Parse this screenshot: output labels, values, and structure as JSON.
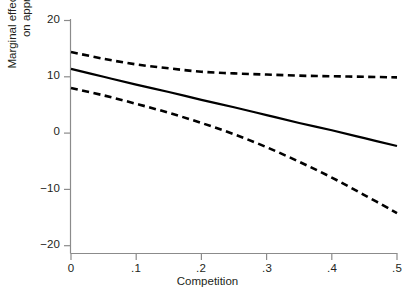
{
  "chart_data": {
    "type": "line",
    "title": "",
    "subtitle": "",
    "xlabel": "Competition",
    "ylabel_line1": "Marginal effect of grants",
    "ylabel_line2": "on approval",
    "ylabel": "Marginal effect of grants on approval",
    "xlim": [
      0,
      0.5
    ],
    "ylim": [
      -20,
      20
    ],
    "xticks": [
      0,
      0.1,
      0.2,
      0.3,
      0.4,
      0.5
    ],
    "xtick_labels": [
      "0",
      ".1",
      ".2",
      ".3",
      ".4",
      ".5"
    ],
    "yticks": [
      20,
      10,
      0,
      -10,
      -20
    ],
    "ytick_labels": [
      "20",
      "10",
      "0",
      "−10",
      "−20"
    ],
    "grid": false,
    "legend": "none",
    "axis_color": "#8b8b8b",
    "line_color": "#000000",
    "series": [
      {
        "name": "Upper confidence bound",
        "style": "dashed",
        "x": [
          0,
          0.05,
          0.1,
          0.15,
          0.2,
          0.25,
          0.3,
          0.35,
          0.4,
          0.45,
          0.5
        ],
        "values": [
          14.4,
          13.2,
          12.2,
          11.5,
          10.9,
          10.6,
          10.4,
          10.2,
          10.1,
          10.0,
          9.9
        ]
      },
      {
        "name": "Marginal effect of grants on approval",
        "style": "solid",
        "x": [
          0,
          0.05,
          0.1,
          0.15,
          0.2,
          0.25,
          0.3,
          0.35,
          0.4,
          0.45,
          0.5
        ],
        "values": [
          11.4,
          10.0,
          8.6,
          7.3,
          5.9,
          4.6,
          3.2,
          1.8,
          0.5,
          -0.9,
          -2.3
        ]
      },
      {
        "name": "Lower confidence bound",
        "style": "dashed",
        "x": [
          0,
          0.05,
          0.1,
          0.15,
          0.2,
          0.25,
          0.3,
          0.35,
          0.4,
          0.45,
          0.5
        ],
        "values": [
          8.0,
          6.7,
          5.2,
          3.6,
          1.8,
          -0.2,
          -2.5,
          -5.1,
          -7.9,
          -11.0,
          -14.2
        ]
      }
    ]
  },
  "axis": {
    "y_title_line1": "Marginal effect of grants",
    "y_title_line2": "on approval",
    "x_title": "Competition",
    "ytick_0": "20",
    "ytick_1": "10",
    "ytick_2": "0",
    "ytick_3": "−10",
    "ytick_4": "−20",
    "xtick_0": "0",
    "xtick_1": ".1",
    "xtick_2": ".2",
    "xtick_3": ".3",
    "xtick_4": ".4",
    "xtick_5": ".5"
  }
}
